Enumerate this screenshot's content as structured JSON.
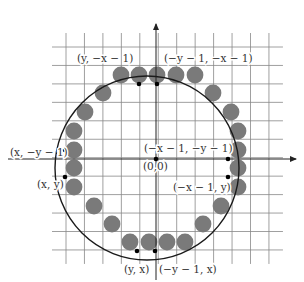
{
  "diagram": {
    "colors": {
      "grid": "#888888",
      "pixel": "#7a7a7a",
      "circle": "#1a1a1a",
      "axis": "#222222",
      "point": "#000000",
      "label": "#333333"
    },
    "grid": {
      "x0": 66,
      "y0": 47,
      "step": 18.45,
      "cols": 11,
      "rows": 11
    },
    "origin": {
      "x": 156,
      "y": 159,
      "label": "(0,0)"
    },
    "circle": {
      "cx": 147,
      "cy": 168,
      "r": 92
    },
    "pixels": [
      [
        139,
        75
      ],
      [
        157,
        75
      ],
      [
        176,
        75
      ],
      [
        195,
        75
      ],
      [
        121,
        75
      ],
      [
        103,
        93
      ],
      [
        85,
        112
      ],
      [
        213,
        93
      ],
      [
        231,
        112
      ],
      [
        74,
        131
      ],
      [
        74,
        150
      ],
      [
        74,
        168
      ],
      [
        74,
        187
      ],
      [
        238,
        131
      ],
      [
        238,
        150
      ],
      [
        238,
        168
      ],
      [
        238,
        187
      ],
      [
        94,
        206
      ],
      [
        112,
        224
      ],
      [
        130,
        242
      ],
      [
        149,
        242
      ],
      [
        167,
        242
      ],
      [
        185,
        242
      ],
      [
        203,
        224
      ],
      [
        221,
        206
      ]
    ],
    "points": [
      {
        "x": 139,
        "y": 84
      },
      {
        "x": 157,
        "y": 84
      },
      {
        "x": 65,
        "y": 150
      },
      {
        "x": 65,
        "y": 177
      },
      {
        "x": 228,
        "y": 159
      },
      {
        "x": 228,
        "y": 177
      },
      {
        "x": 137,
        "y": 251
      },
      {
        "x": 155,
        "y": 251
      },
      {
        "x": 156,
        "y": 159
      }
    ],
    "labels": [
      {
        "text": "(y, −x − 1)",
        "x": 77,
        "y": 62
      },
      {
        "text": "(−y − 1, −x − 1)",
        "x": 164,
        "y": 62
      },
      {
        "text": "(x, −y − 1)",
        "x": 10,
        "y": 156
      },
      {
        "text": "(−x − 1, −y − 1)",
        "x": 144,
        "y": 152
      },
      {
        "text": "(0,0)",
        "x": 143,
        "y": 170
      },
      {
        "text": "(x, y)",
        "x": 37,
        "y": 188
      },
      {
        "text": "(−x − 1, y)",
        "x": 173,
        "y": 191
      },
      {
        "text": "(y, x)",
        "x": 124,
        "y": 273
      },
      {
        "text": "(−y − 1, x)",
        "x": 159,
        "y": 273
      }
    ]
  }
}
